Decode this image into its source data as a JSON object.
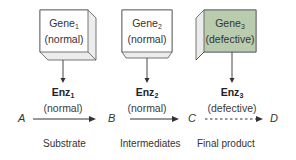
{
  "genes": [
    {
      "name": "Gene",
      "sub": "1",
      "state": "(normal)",
      "fill": "#ffffff"
    },
    {
      "name": "Gene",
      "sub": "2",
      "state": "(normal)",
      "fill": "#ffffff"
    },
    {
      "name": "Gene",
      "sub": "3",
      "state": "(defective)",
      "fill": "#b9ccae"
    }
  ],
  "enzymes": [
    {
      "name": "Enz",
      "sub": "1",
      "state": "(normal)"
    },
    {
      "name": "Enz",
      "sub": "2",
      "state": "(normal)"
    },
    {
      "name": "Enz",
      "sub": "3",
      "state": "(defective)"
    }
  ],
  "metabolites": [
    "A",
    "B",
    "C",
    "D"
  ],
  "categories": [
    "Substrate",
    "Intermediates",
    "Final product"
  ],
  "colors": {
    "line": "#333333",
    "defective_fill": "#b9ccae",
    "box_side": "#e8e8e8"
  }
}
